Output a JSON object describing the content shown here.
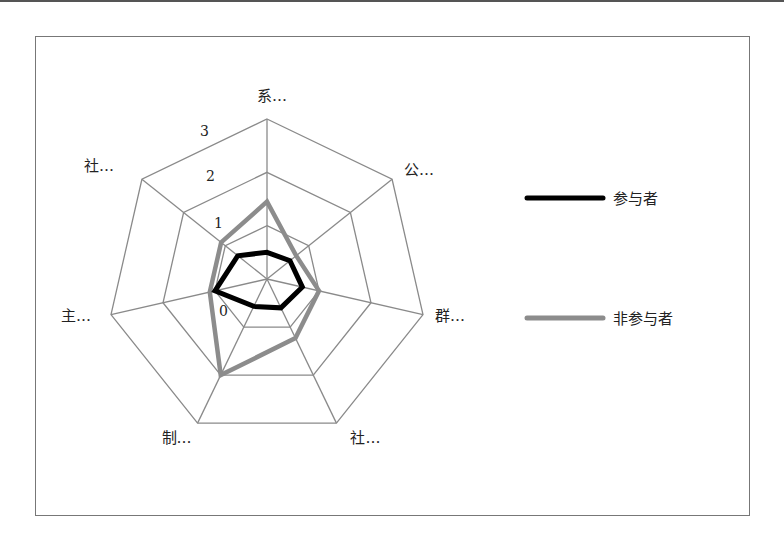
{
  "chart_data": {
    "type": "radar",
    "title": "",
    "categories": [
      "系…",
      "公…",
      "群…",
      "社…",
      "制…",
      "主…",
      "社…"
    ],
    "axis": {
      "min": 0,
      "max": 3,
      "ticks": [
        0,
        1,
        2,
        3
      ],
      "tick_labels": [
        "0",
        "1",
        "2",
        "3"
      ]
    },
    "grid": true,
    "legend_position": "right",
    "series": [
      {
        "name": "参与者",
        "color": "#000000",
        "values": [
          0.5,
          0.55,
          0.68,
          0.6,
          0.57,
          1.0,
          0.7
        ]
      },
      {
        "name": "非参与者",
        "color": "#8c8c8c",
        "values": [
          1.45,
          0.7,
          1.0,
          1.23,
          2.0,
          1.1,
          1.1
        ]
      }
    ]
  }
}
